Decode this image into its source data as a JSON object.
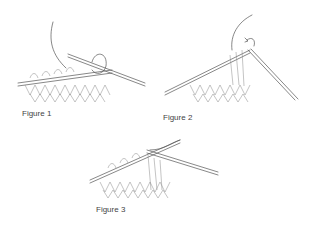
{
  "figures": [
    {
      "id": 1,
      "label": "Figure 1",
      "description": "Knitting stitches on needle with working yarn wrapped around right needle"
    },
    {
      "id": 2,
      "label": "Figure 2",
      "description": "Right needle pulling loop through with rotation arrow"
    },
    {
      "id": 3,
      "label": "Figure 3",
      "description": "New stitch transferred onto right needle"
    }
  ],
  "colors": {
    "line": "#555555",
    "background": "#ffffff",
    "label": "#444444"
  }
}
